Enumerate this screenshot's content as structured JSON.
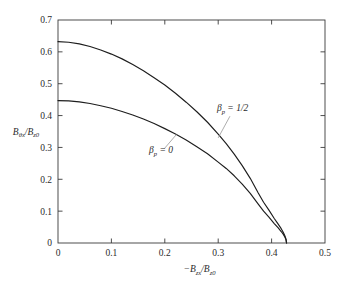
{
  "chart_data": {
    "type": "line",
    "title": "",
    "subtitle": "",
    "xlabel": "−B_zx/B_z0",
    "ylabel": "B_θx/B_z0",
    "xlabel_parts": {
      "prefix": "−B",
      "sub1": "zx",
      "mid": "/B",
      "sub2": "z0"
    },
    "ylabel_parts": {
      "prefix": "B",
      "sub1": "θx",
      "mid": "/B",
      "sub2": "z0"
    },
    "xlim": [
      0,
      0.5
    ],
    "ylim": [
      0,
      0.7
    ],
    "xticks": [
      0,
      0.1,
      0.2,
      0.3,
      0.4,
      0.5
    ],
    "yticks": [
      0,
      0.1,
      0.2,
      0.3,
      0.4,
      0.5,
      0.6,
      0.7
    ],
    "xticklabels": [
      "0",
      "0.1",
      "0.2",
      "0.3",
      "0.4",
      "0.5"
    ],
    "yticklabels": [
      "0",
      "0.1",
      "0.2",
      "0.3",
      "0.4",
      "0.5",
      "0.6",
      "0.7"
    ],
    "grid": false,
    "legend": "inline-annotations",
    "line_color": "#1d1d1d",
    "frame_color": "#3a3a3a",
    "series": [
      {
        "name": "beta_p = 1/2",
        "label_parts": {
          "beta": "β",
          "sub": "p",
          "eq": " = 1/2"
        },
        "label_x": 0.327,
        "label_y": 0.414,
        "leader_from": [
          0.322,
          0.398
        ],
        "leader_to": [
          0.3,
          0.33
        ],
        "x": [
          0.0,
          0.02,
          0.04,
          0.06,
          0.08,
          0.1,
          0.12,
          0.14,
          0.16,
          0.18,
          0.2,
          0.22,
          0.24,
          0.26,
          0.28,
          0.3,
          0.315,
          0.33,
          0.345,
          0.36,
          0.375,
          0.385,
          0.395,
          0.405,
          0.412,
          0.418,
          0.422,
          0.425,
          0.427,
          0.428
        ],
        "y": [
          0.632,
          0.63,
          0.625,
          0.617,
          0.606,
          0.593,
          0.578,
          0.56,
          0.541,
          0.519,
          0.496,
          0.47,
          0.442,
          0.412,
          0.379,
          0.342,
          0.312,
          0.279,
          0.243,
          0.203,
          0.157,
          0.128,
          0.103,
          0.077,
          0.06,
          0.045,
          0.033,
          0.022,
          0.012,
          0.0
        ]
      },
      {
        "name": "beta_p = 0",
        "label_parts": {
          "beta": "β",
          "sub": "p",
          "eq": " = 0"
        },
        "label_x": 0.193,
        "label_y": 0.281,
        "leader_from": [
          0.199,
          0.296
        ],
        "leader_to": [
          0.222,
          0.341
        ],
        "x": [
          0.0,
          0.02,
          0.04,
          0.06,
          0.08,
          0.1,
          0.12,
          0.14,
          0.16,
          0.18,
          0.2,
          0.22,
          0.24,
          0.26,
          0.28,
          0.3,
          0.315,
          0.33,
          0.345,
          0.36,
          0.375,
          0.385,
          0.395,
          0.405,
          0.412,
          0.418,
          0.422,
          0.425,
          0.427,
          0.428
        ],
        "y": [
          0.447,
          0.446,
          0.443,
          0.438,
          0.431,
          0.423,
          0.413,
          0.402,
          0.389,
          0.375,
          0.359,
          0.342,
          0.323,
          0.302,
          0.28,
          0.254,
          0.234,
          0.211,
          0.185,
          0.156,
          0.122,
          0.1,
          0.081,
          0.061,
          0.048,
          0.036,
          0.027,
          0.018,
          0.01,
          0.0
        ]
      }
    ]
  }
}
